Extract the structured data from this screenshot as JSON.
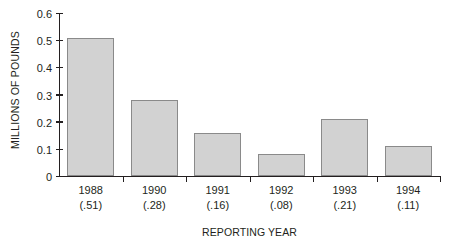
{
  "chart_data": {
    "type": "bar",
    "title": "",
    "xlabel": "REPORTING YEAR",
    "ylabel": "MILLIONS OF POUNDS",
    "categories": [
      "1988",
      "1990",
      "1991",
      "1992",
      "1993",
      "1994"
    ],
    "category_sublabels": [
      "(.51)",
      "(.28)",
      "(.16)",
      "(.08)",
      "(.21)",
      "(.11)"
    ],
    "values": [
      0.51,
      0.28,
      0.16,
      0.08,
      0.21,
      0.11
    ],
    "ylim": [
      0,
      0.6
    ],
    "ytick_labels": [
      "0",
      "0.1",
      "0.2",
      "0.3",
      "0.4",
      "0.5",
      "0.6"
    ],
    "ytick_values": [
      0,
      0.1,
      0.2,
      0.3,
      0.4,
      0.5,
      0.6
    ],
    "grid": false,
    "legend": false,
    "bar_fill_color": "#d2d2d2",
    "bar_edge_color": "#8a8a8a",
    "axis_color": "#231f20",
    "background_color": "#ffffff"
  }
}
